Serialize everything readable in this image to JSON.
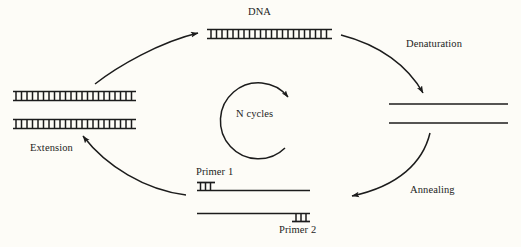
{
  "diagram": {
    "background_color": "#fdfcf7",
    "ink_color": "#1c1c1c"
  },
  "labels": {
    "dna": "DNA",
    "denaturation": "Denaturation",
    "annealing": "Annealing",
    "extension": "Extension",
    "n_cycles": "N cycles",
    "primer1": "Primer 1",
    "primer2": "Primer 2"
  },
  "stages": [
    {
      "id": "dna-template",
      "label": "DNA",
      "position": "top-center",
      "representation": "double-stranded-ladder",
      "strand_count": 1,
      "rungs": 22
    },
    {
      "id": "denatured-strands",
      "label": "",
      "position": "right",
      "representation": "two-single-lines",
      "strand_count": 2,
      "rungs": 0
    },
    {
      "id": "annealed-primers",
      "label": "",
      "position": "bottom-center",
      "representation": "two-single-lines-with-primer-ladders",
      "strand_count": 2,
      "primer_rungs": 3
    },
    {
      "id": "extended-products",
      "label": "",
      "position": "left",
      "representation": "two-double-stranded-ladders",
      "strand_count": 2,
      "rungs": 22
    }
  ],
  "arrows": [
    {
      "id": "arrow-denaturation",
      "label": "Denaturation",
      "from": "dna-template",
      "to": "denatured-strands",
      "direction": "clockwise"
    },
    {
      "id": "arrow-annealing",
      "label": "Annealing",
      "from": "denatured-strands",
      "to": "annealed-primers",
      "direction": "clockwise"
    },
    {
      "id": "arrow-extension",
      "label": "Extension",
      "from": "annealed-primers",
      "to": "extended-products",
      "direction": "clockwise"
    },
    {
      "id": "arrow-repeat",
      "label": "",
      "from": "extended-products",
      "to": "dna-template",
      "direction": "clockwise"
    },
    {
      "id": "arrow-n-cycles",
      "label": "N cycles",
      "from": "",
      "to": "",
      "direction": "clockwise"
    }
  ]
}
